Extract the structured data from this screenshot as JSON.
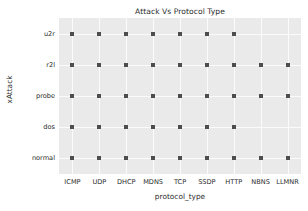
{
  "chart_data": {
    "type": "scatter",
    "title": "Attack Vs Protocol Type",
    "xlabel": "protocol_type",
    "ylabel": "xAttack",
    "categories": [
      "ICMP",
      "UDP",
      "DHCP",
      "MDNS",
      "TCP",
      "SSDP",
      "HTTP",
      "NBNS",
      "LLMNR"
    ],
    "y_categories": [
      "normal",
      "dos",
      "probe",
      "r2l",
      "u2r"
    ],
    "grid": true,
    "legend": "none",
    "marker": "square",
    "marker_color": "#4d4d4d",
    "plot_background": "#eaeaea",
    "gridline_color": "#fbfbfb",
    "points": [
      {
        "x": "ICMP",
        "y": "u2r"
      },
      {
        "x": "UDP",
        "y": "u2r"
      },
      {
        "x": "DHCP",
        "y": "u2r"
      },
      {
        "x": "MDNS",
        "y": "u2r"
      },
      {
        "x": "TCP",
        "y": "u2r"
      },
      {
        "x": "SSDP",
        "y": "u2r"
      },
      {
        "x": "HTTP",
        "y": "u2r"
      },
      {
        "x": "ICMP",
        "y": "r2l"
      },
      {
        "x": "UDP",
        "y": "r2l"
      },
      {
        "x": "DHCP",
        "y": "r2l"
      },
      {
        "x": "MDNS",
        "y": "r2l"
      },
      {
        "x": "TCP",
        "y": "r2l"
      },
      {
        "x": "SSDP",
        "y": "r2l"
      },
      {
        "x": "HTTP",
        "y": "r2l"
      },
      {
        "x": "NBNS",
        "y": "r2l"
      },
      {
        "x": "LLMNR",
        "y": "r2l"
      },
      {
        "x": "ICMP",
        "y": "probe"
      },
      {
        "x": "UDP",
        "y": "probe"
      },
      {
        "x": "DHCP",
        "y": "probe"
      },
      {
        "x": "MDNS",
        "y": "probe"
      },
      {
        "x": "TCP",
        "y": "probe"
      },
      {
        "x": "SSDP",
        "y": "probe"
      },
      {
        "x": "HTTP",
        "y": "probe"
      },
      {
        "x": "NBNS",
        "y": "probe"
      },
      {
        "x": "LLMNR",
        "y": "probe"
      },
      {
        "x": "ICMP",
        "y": "dos"
      },
      {
        "x": "UDP",
        "y": "dos"
      },
      {
        "x": "DHCP",
        "y": "dos"
      },
      {
        "x": "MDNS",
        "y": "dos"
      },
      {
        "x": "TCP",
        "y": "dos"
      },
      {
        "x": "SSDP",
        "y": "dos"
      },
      {
        "x": "HTTP",
        "y": "dos"
      },
      {
        "x": "ICMP",
        "y": "normal"
      },
      {
        "x": "UDP",
        "y": "normal"
      },
      {
        "x": "DHCP",
        "y": "normal"
      },
      {
        "x": "MDNS",
        "y": "normal"
      },
      {
        "x": "TCP",
        "y": "normal"
      },
      {
        "x": "SSDP",
        "y": "normal"
      },
      {
        "x": "HTTP",
        "y": "normal"
      },
      {
        "x": "NBNS",
        "y": "normal"
      },
      {
        "x": "LLMNR",
        "y": "normal"
      }
    ]
  }
}
